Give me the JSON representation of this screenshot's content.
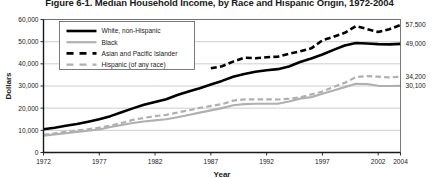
{
  "figure": {
    "title": "Figure 6-1. Median Household Income, by Race and Hispanic Origin, 1972-2004"
  },
  "axes": {
    "ylabel": "Dollars",
    "xlabel": "Year",
    "yticks": [
      "0",
      "10,000",
      "20,000",
      "30,000",
      "40,000",
      "50,000",
      "60,000"
    ],
    "xticks": [
      "1972",
      "1977",
      "1982",
      "1987",
      "1992",
      "1997",
      "2002",
      "2004"
    ]
  },
  "legend": {
    "items": [
      {
        "label": "White, non-Hispanic",
        "style": "solid",
        "color": "#000000",
        "width": 2.6
      },
      {
        "label": "Black",
        "style": "solid",
        "color": "#b0b0b0",
        "width": 2.2
      },
      {
        "label": "Asian and Pacific Islander",
        "style": "dashed",
        "color": "#000000",
        "width": 2.6
      },
      {
        "label": "Hispanic (of any race)",
        "style": "dashed",
        "color": "#b0b0b0",
        "width": 2.2
      }
    ]
  },
  "end_labels": [
    {
      "series": "Asian and Pacific Islander",
      "value": "57,500",
      "y": 57500
    },
    {
      "series": "White, non-Hispanic",
      "value": "49,000",
      "y": 49000
    },
    {
      "series": "Hispanic (of any race)",
      "value": "34,200",
      "y": 34200
    },
    {
      "series": "Black",
      "value": "30,100",
      "y": 30100
    }
  ],
  "chart_data": {
    "type": "line",
    "title": "Figure 6-1. Median Household Income, by Race and Hispanic Origin, 1972-2004",
    "xlabel": "Year",
    "ylabel": "Dollars",
    "xlim": [
      1972,
      2004
    ],
    "ylim": [
      0,
      60000
    ],
    "ytick_values": [
      0,
      10000,
      20000,
      30000,
      40000,
      50000,
      60000
    ],
    "xtick_values": [
      1972,
      1977,
      1982,
      1987,
      1992,
      1997,
      2002,
      2004
    ],
    "grid": "horizontal",
    "legend_position": "upper-left-inside",
    "x": [
      1972,
      1973,
      1974,
      1975,
      1976,
      1977,
      1978,
      1979,
      1980,
      1981,
      1982,
      1983,
      1984,
      1985,
      1986,
      1987,
      1988,
      1989,
      1990,
      1991,
      1992,
      1993,
      1994,
      1995,
      1996,
      1997,
      1998,
      1999,
      2000,
      2001,
      2002,
      2003,
      2004
    ],
    "series": [
      {
        "name": "White, non-Hispanic",
        "color": "#000000",
        "style": "solid",
        "values": [
          10500,
          11200,
          12100,
          12900,
          13900,
          15000,
          16400,
          18200,
          19900,
          21500,
          22800,
          24000,
          25900,
          27500,
          29000,
          30700,
          32300,
          34200,
          35400,
          36400,
          37100,
          37600,
          38800,
          40800,
          42400,
          44200,
          46300,
          48300,
          49400,
          49200,
          48900,
          48800,
          49000
        ]
      },
      {
        "name": "Black",
        "color": "#b0b0b0",
        "style": "solid",
        "values": [
          7600,
          8200,
          8700,
          9300,
          9800,
          10400,
          11500,
          12400,
          13300,
          14000,
          14500,
          15000,
          15900,
          16900,
          18000,
          19000,
          20000,
          21300,
          21800,
          22000,
          22000,
          22000,
          23000,
          24300,
          25000,
          26500,
          28000,
          29500,
          31000,
          30900,
          30100,
          30000,
          30100
        ]
      },
      {
        "name": "Asian and Pacific Islander",
        "color": "#000000",
        "style": "dashed",
        "values": [
          null,
          null,
          null,
          null,
          null,
          null,
          null,
          null,
          null,
          null,
          null,
          null,
          null,
          null,
          null,
          38000,
          38900,
          41000,
          42800,
          42500,
          43000,
          43200,
          44500,
          45600,
          47000,
          50600,
          52200,
          54000,
          57000,
          55700,
          54400,
          55600,
          57500
        ]
      },
      {
        "name": "Hispanic (of any race)",
        "color": "#b0b0b0",
        "style": "dashed",
        "values": [
          8000,
          8600,
          9400,
          9900,
          10500,
          11200,
          12100,
          13300,
          14700,
          15600,
          16400,
          17000,
          18000,
          19000,
          20100,
          21000,
          21800,
          23400,
          24000,
          24000,
          24000,
          23900,
          24300,
          24900,
          26200,
          27500,
          29600,
          31400,
          34000,
          34500,
          34200,
          33900,
          34200
        ]
      }
    ]
  }
}
